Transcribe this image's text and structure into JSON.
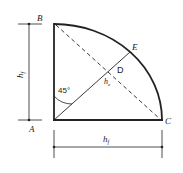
{
  "diagram": {
    "points": {
      "A": "A",
      "B": "B",
      "C": "C",
      "D": "D",
      "E": "E"
    },
    "labels": {
      "vertical_dimension": "h",
      "vertical_dimension_sub": "f",
      "horizontal_dimension": "h",
      "horizontal_dimension_sub": "f",
      "throat": "h",
      "throat_sub": "e",
      "angle": "45°"
    },
    "colors": {
      "stroke": "#222222",
      "background": "#ffffff"
    }
  }
}
